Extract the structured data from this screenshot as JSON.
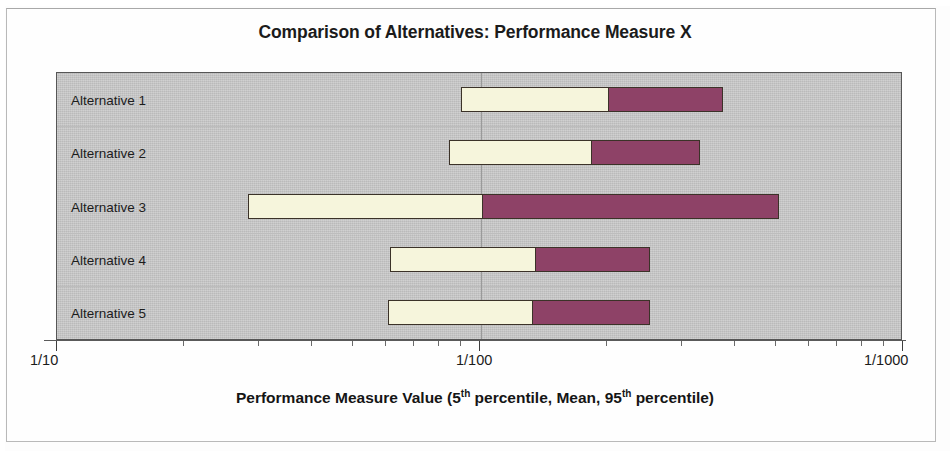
{
  "chart_data": {
    "type": "bar",
    "subtype": "stacked-range-bar",
    "title": "Comparison of Alternatives: Performance Measure X",
    "xlabel": "Performance Measure Value (5th percentile, Mean, 95th percentile)",
    "xlabel_parts": {
      "pre": "Performance Measure Value (5",
      "sup1": "th",
      "mid": " percentile, Mean, 95",
      "sup2": "th",
      "post": " percentile)"
    },
    "ylabel": "",
    "scale": "log-reciprocal",
    "axis_tick_labels": [
      "1/10",
      "1/100",
      "1/1000"
    ],
    "xlim_labels": [
      "1/10",
      "1/1000"
    ],
    "grid": true,
    "legend": "none",
    "categories": [
      "Alternative 1",
      "Alternative 2",
      "Alternative 3",
      "Alternative 4",
      "Alternative 5"
    ],
    "series": [
      {
        "name": "5th percentile to Mean",
        "color": "#f6f5dc",
        "values": [
          "1/186",
          "1/169",
          "1/82",
          "1/135",
          "1/133"
        ]
      },
      {
        "name": "Mean to 95th percentile",
        "color": "#8e4267",
        "values": [
          "1/325",
          "1/295",
          "1/505",
          "1/238",
          "1/238"
        ]
      }
    ],
    "bars": [
      {
        "category": "Alternative 1",
        "p5_label": "1/90",
        "p5_pos": 0.4775,
        "mean_label": "1/186",
        "mean_pos": 0.6525,
        "p95_label": "1/325",
        "p95_pos": 0.7869
      },
      {
        "category": "Alternative 2",
        "p5_label": "1/84",
        "p5_pos": 0.4634,
        "mean_label": "1/169",
        "mean_pos": 0.6323,
        "p95_label": "1/295",
        "p95_pos": 0.7597
      },
      {
        "category": "Alternative 3",
        "p5_label": "1/31",
        "p5_pos": 0.2254,
        "mean_label": "1/82",
        "mean_pos": 0.5041,
        "p95_label": "1/505",
        "p95_pos": 0.8536
      },
      {
        "category": "Alternative 4",
        "p5_label": "1/63",
        "p5_pos": 0.3936,
        "mean_label": "1/135",
        "mean_pos": 0.5662,
        "p95_label": "1/238",
        "p95_pos": 0.7014
      },
      {
        "category": "Alternative 5",
        "p5_label": "1/62",
        "p5_pos": 0.3912,
        "mean_label": "1/133",
        "mean_pos": 0.5627,
        "p95_label": "1/238",
        "p95_pos": 0.7014
      }
    ],
    "colors": {
      "plot_background": "#c7c7c7",
      "low_segment": "#f6f5dc",
      "high_segment": "#8e4267",
      "bar_outline": "#3b3228",
      "axis": "#3d3d3d",
      "text": "#1b1b1b"
    }
  }
}
